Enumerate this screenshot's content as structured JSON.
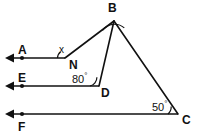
{
  "figure": {
    "type": "geometry-diagram",
    "background_color": "#ffffff",
    "stroke_color": "#111111",
    "width": 197,
    "height": 138
  },
  "points": [
    {
      "id": "B",
      "label": "B",
      "x": 114,
      "y": 21,
      "label_x": 108,
      "label_y": 2
    },
    {
      "id": "N",
      "label": "N",
      "x": 65,
      "y": 58,
      "label_x": 69,
      "label_y": 59
    },
    {
      "id": "D",
      "label": "D",
      "x": 99,
      "y": 86,
      "label_x": 101,
      "label_y": 87
    },
    {
      "id": "C",
      "label": "C",
      "x": 178,
      "y": 114,
      "label_x": 182,
      "label_y": 114
    }
  ],
  "rays": [
    {
      "id": "A",
      "label": "A",
      "label_x": 18,
      "label_y": 44,
      "y": 58,
      "arrow_x": 9,
      "dot_x": 22,
      "end_x": 65
    },
    {
      "id": "E",
      "label": "E",
      "label_x": 18,
      "label_y": 72,
      "y": 86,
      "arrow_x": 9,
      "dot_x": 22,
      "end_x": 99
    },
    {
      "id": "F",
      "label": "F",
      "label_x": 18,
      "label_y": 121,
      "y": 114,
      "arrow_x": 9,
      "dot_x": 22,
      "end_x": 178
    }
  ],
  "segments": [
    {
      "id": "BN",
      "from": "B",
      "to": "N"
    },
    {
      "id": "BD",
      "from": "B",
      "to": "D"
    },
    {
      "id": "BC",
      "from": "B",
      "to": "C"
    }
  ],
  "angles": [
    {
      "id": "angle-x-at-N",
      "vertex": "N",
      "label": "x",
      "value": "x",
      "label_x": 59,
      "label_y": 45,
      "has_arc": true
    },
    {
      "id": "angle-80-at-D",
      "vertex": "D",
      "label": "80",
      "degrees": 80,
      "unit": "°",
      "label_x": 72,
      "label_y": 72,
      "has_arc": true
    },
    {
      "id": "angle-50-at-C",
      "vertex": "C",
      "label": "50",
      "degrees": 50,
      "unit": "°",
      "label_x": 152,
      "label_y": 100,
      "has_arc": true
    },
    {
      "id": "angle-at-B",
      "vertex": "B",
      "label": "",
      "has_arc": true
    }
  ]
}
